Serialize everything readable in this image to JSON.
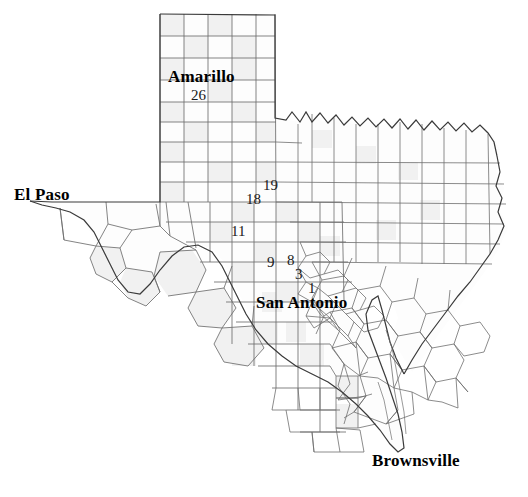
{
  "map": {
    "title": "Texas County Map with Study Sites",
    "region": "Texas",
    "background_color": "#ffffff",
    "county_fill": "#fdfdfd",
    "county_fill_shaded": "#f0f0f0",
    "county_border_color": "#777777",
    "state_border_color": "#404040",
    "label_color": "#000000"
  },
  "cities": [
    {
      "name": "Amarillo",
      "x": 168,
      "y": 68,
      "font_size": 17
    },
    {
      "name": "El Paso",
      "x": 14,
      "y": 186,
      "font_size": 17
    },
    {
      "name": "San Antonio",
      "x": 256,
      "y": 294,
      "font_size": 17
    },
    {
      "name": "Brownsville",
      "x": 372,
      "y": 452,
      "font_size": 17
    }
  ],
  "sites": [
    {
      "label": "26",
      "x": 191,
      "y": 88,
      "font_size": 15
    },
    {
      "label": "19",
      "x": 263,
      "y": 178,
      "font_size": 15
    },
    {
      "label": "18",
      "x": 246,
      "y": 192,
      "font_size": 15
    },
    {
      "label": "11",
      "x": 231,
      "y": 224,
      "font_size": 15
    },
    {
      "label": "9",
      "x": 267,
      "y": 255,
      "font_size": 15
    },
    {
      "label": "8",
      "x": 287,
      "y": 253,
      "font_size": 15
    },
    {
      "label": "3",
      "x": 295,
      "y": 267,
      "font_size": 15
    },
    {
      "label": "1",
      "x": 308,
      "y": 281,
      "font_size": 15
    }
  ]
}
